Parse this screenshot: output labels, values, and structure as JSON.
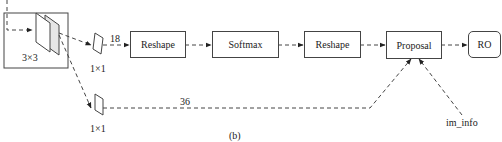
{
  "diagram": {
    "caption": "(b)",
    "conv3x3": {
      "label": "3×3"
    },
    "conv1x1_top": {
      "label": "1×1",
      "channels": "18"
    },
    "conv1x1_bottom": {
      "label": "1×1",
      "channels": "36"
    },
    "nodes": {
      "reshape1": "Reshape",
      "softmax": "Softmax",
      "reshape2": "Reshape",
      "proposal": "Proposal",
      "roi": "RO"
    },
    "inputs": {
      "im_info": "im_info"
    },
    "edges": [
      [
        "input",
        "conv3x3"
      ],
      [
        "conv3x3",
        "conv1x1_top"
      ],
      [
        "conv3x3",
        "conv1x1_bottom"
      ],
      [
        "conv1x1_top",
        "reshape1"
      ],
      [
        "reshape1",
        "softmax"
      ],
      [
        "softmax",
        "reshape2"
      ],
      [
        "reshape2",
        "proposal"
      ],
      [
        "conv1x1_bottom",
        "proposal"
      ],
      [
        "im_info",
        "proposal"
      ],
      [
        "proposal",
        "roi"
      ]
    ],
    "colors": {
      "line": "#444444",
      "plane_fill": "#f2f2f2"
    }
  }
}
